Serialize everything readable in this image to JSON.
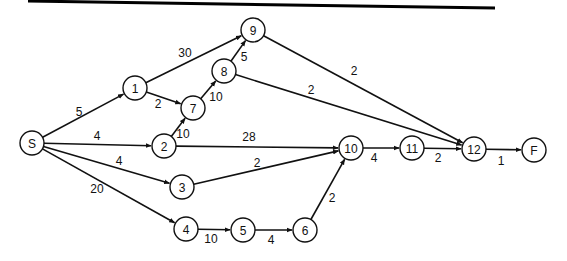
{
  "diagram": {
    "type": "network-activity-diagram",
    "node_radius": 12,
    "nodes": [
      {
        "id": "S",
        "label": "S",
        "x": 32,
        "y": 143
      },
      {
        "id": "1",
        "label": "1",
        "x": 135,
        "y": 88
      },
      {
        "id": "2",
        "label": "2",
        "x": 164,
        "y": 146
      },
      {
        "id": "3",
        "label": "3",
        "x": 182,
        "y": 187
      },
      {
        "id": "4",
        "label": "4",
        "x": 186,
        "y": 229
      },
      {
        "id": "5",
        "label": "5",
        "x": 243,
        "y": 230
      },
      {
        "id": "6",
        "label": "6",
        "x": 305,
        "y": 230
      },
      {
        "id": "7",
        "label": "7",
        "x": 193,
        "y": 108
      },
      {
        "id": "8",
        "label": "8",
        "x": 224,
        "y": 71
      },
      {
        "id": "9",
        "label": "9",
        "x": 253,
        "y": 30
      },
      {
        "id": "10",
        "label": "10",
        "x": 351,
        "y": 148
      },
      {
        "id": "11",
        "label": "11",
        "x": 412,
        "y": 148
      },
      {
        "id": "12",
        "label": "12",
        "x": 474,
        "y": 149
      },
      {
        "id": "F",
        "label": "F",
        "x": 534,
        "y": 150
      }
    ],
    "edges": [
      {
        "from": "S",
        "to": "1",
        "weight": "5",
        "lx": 79,
        "ly": 112
      },
      {
        "from": "S",
        "to": "2",
        "weight": "4",
        "lx": 97,
        "ly": 136
      },
      {
        "from": "S",
        "to": "3",
        "weight": "4",
        "lx": 119,
        "ly": 161
      },
      {
        "from": "S",
        "to": "4",
        "weight": "20",
        "lx": 97,
        "ly": 189
      },
      {
        "from": "1",
        "to": "9",
        "weight": "30",
        "lx": 185,
        "ly": 53
      },
      {
        "from": "1",
        "to": "7",
        "weight": "2",
        "lx": 158,
        "ly": 104
      },
      {
        "from": "2",
        "to": "7",
        "weight": "10",
        "lx": 183,
        "ly": 134
      },
      {
        "from": "7",
        "to": "8",
        "weight": "10",
        "lx": 216,
        "ly": 97
      },
      {
        "from": "8",
        "to": "9",
        "weight": "5",
        "lx": 244,
        "ly": 57
      },
      {
        "from": "9",
        "to": "12",
        "weight": "2",
        "lx": 354,
        "ly": 71
      },
      {
        "from": "8",
        "to": "12",
        "weight": "2",
        "lx": 311,
        "ly": 90
      },
      {
        "from": "2",
        "to": "10",
        "weight": "28",
        "lx": 249,
        "ly": 137
      },
      {
        "from": "3",
        "to": "10",
        "weight": "2",
        "lx": 257,
        "ly": 163
      },
      {
        "from": "4",
        "to": "5",
        "weight": "10",
        "lx": 211,
        "ly": 239
      },
      {
        "from": "5",
        "to": "6",
        "weight": "4",
        "lx": 271,
        "ly": 240
      },
      {
        "from": "6",
        "to": "10",
        "weight": "2",
        "lx": 332,
        "ly": 198
      },
      {
        "from": "10",
        "to": "11",
        "weight": "4",
        "lx": 374,
        "ly": 158
      },
      {
        "from": "11",
        "to": "12",
        "weight": "2",
        "lx": 438,
        "ly": 158
      },
      {
        "from": "12",
        "to": "F",
        "weight": "1",
        "lx": 501,
        "ly": 161
      }
    ]
  },
  "colors": {
    "line": "#111111",
    "background": "#ffffff"
  }
}
